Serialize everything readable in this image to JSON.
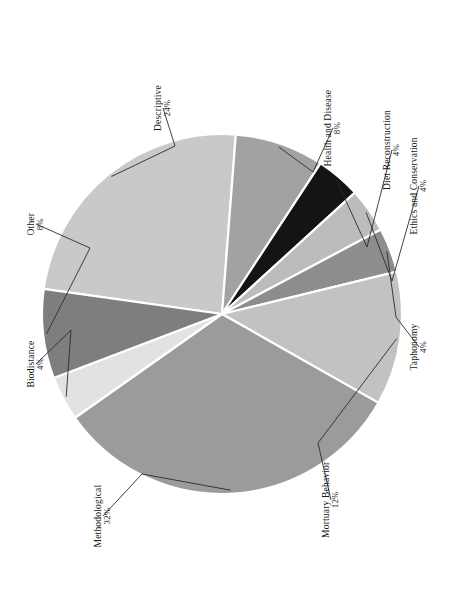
{
  "figure": {
    "background_color": "#ffffff",
    "leader_line_color": "#2b2b2b",
    "slice_separator_color": "#ffffff"
  },
  "chart_data": {
    "type": "pie",
    "title": "",
    "subtitle": "",
    "xlabel": "",
    "ylabel": "",
    "legend_position": "none",
    "grid": false,
    "label_format": "name + percent",
    "total_percent": 100,
    "categories": [
      "Descriptive",
      "Health and Disease",
      "Diet Reconstruction",
      "Ethics and Conservation",
      "Taphonomy",
      "Mortuary Behavior",
      "Methodological",
      "Biodistance",
      "Other"
    ],
    "values": [
      24,
      8,
      4,
      4,
      4,
      12,
      32,
      4,
      8
    ],
    "percent_labels": [
      "24%",
      "8%",
      "4%",
      "4%",
      "4%",
      "12%",
      "32%",
      "4%",
      "8%"
    ],
    "colors": [
      "#c9c9c9",
      "#a2a2a2",
      "#141414",
      "#bcbcbc",
      "#8d8d8d",
      "#c2c2c2",
      "#9b9b9b",
      "#e2e2e2",
      "#7e7e7e"
    ],
    "slices": [
      {
        "name": "Descriptive",
        "percent": 24,
        "percent_label": "24%",
        "color": "#c9c9c9",
        "label_line1": "Descriptive",
        "label_line2": "24%"
      },
      {
        "name": "Health and Disease",
        "percent": 8,
        "percent_label": "8%",
        "color": "#a2a2a2",
        "label_line1": "Health and Disease",
        "label_line2": "8%"
      },
      {
        "name": "Diet Reconstruction",
        "percent": 4,
        "percent_label": "4%",
        "color": "#141414",
        "label_line1": "Diet Reconstruction",
        "label_line2": "4%"
      },
      {
        "name": "Ethics and Conservation",
        "percent": 4,
        "percent_label": "4%",
        "color": "#bcbcbc",
        "label_line1": "Ethics and Conservation",
        "label_line2": "4%"
      },
      {
        "name": "Taphonomy",
        "percent": 4,
        "percent_label": "4%",
        "color": "#8d8d8d",
        "label_line1": "Taphonomy",
        "label_line2": "4%"
      },
      {
        "name": "Mortuary Behavior",
        "percent": 12,
        "percent_label": "12%",
        "color": "#c2c2c2",
        "label_line1": "Mortuary Behavior",
        "label_line2": "12%"
      },
      {
        "name": "Methodological",
        "percent": 32,
        "percent_label": "32%",
        "color": "#9b9b9b",
        "label_line1": "Methodological",
        "label_line2": "32%"
      },
      {
        "name": "Biodistance",
        "percent": 4,
        "percent_label": "4%",
        "color": "#e2e2e2",
        "label_line1": "Biodistance",
        "label_line2": "4%"
      },
      {
        "name": "Other",
        "percent": 8,
        "percent_label": "8%",
        "color": "#7e7e7e",
        "label_line1": "Other",
        "label_line2": "8%"
      }
    ]
  }
}
